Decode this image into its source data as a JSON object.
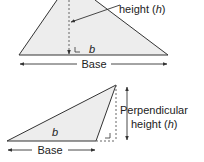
{
  "top_diagram": {
    "height_label": "height (",
    "height_var": "h",
    "height_close": ")",
    "base_var": "b",
    "base_label": "Base"
  },
  "bottom_diagram": {
    "perp_label": "Perpendicular",
    "height_label": "height (",
    "height_var": "h",
    "height_close": ")",
    "base_var": "b",
    "base_label": "Base"
  },
  "colors": {
    "fill": "#ededed",
    "stroke": "#333333",
    "dash": "#666666"
  }
}
